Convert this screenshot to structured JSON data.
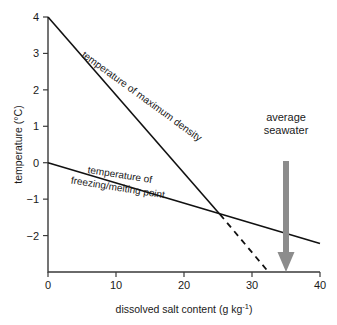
{
  "chart_data": {
    "type": "line",
    "title": "",
    "xlabel": "dissolved salt content (g kg",
    "xlabel_sup": "-1",
    "xlabel_tail": ")",
    "ylabel": "temperature (°C)",
    "xlim": [
      0,
      40
    ],
    "ylim": [
      -3,
      4
    ],
    "xticks": [
      0,
      10,
      20,
      30,
      40
    ],
    "xtick_labels": [
      "0",
      "10",
      "20",
      "30",
      "40"
    ],
    "yticks": [
      4,
      3,
      2,
      1,
      0,
      -1,
      -2
    ],
    "ytick_labels": [
      "4",
      "3",
      "2",
      "1",
      "0",
      "−1",
      "−2"
    ],
    "grid": false,
    "legend": "none",
    "series": [
      {
        "name": "temperature of maximum density",
        "style": "solid",
        "color": "#111111",
        "points": [
          [
            0,
            4.0
          ],
          [
            25.3,
            -1.42
          ]
        ]
      },
      {
        "name": "temperature of maximum density (extrapolated)",
        "style": "dashed",
        "color": "#111111",
        "points": [
          [
            25.3,
            -1.42
          ],
          [
            32.2,
            -2.95
          ]
        ]
      },
      {
        "name": "temperature of freezing/melting point",
        "style": "solid",
        "color": "#111111",
        "points": [
          [
            0,
            0.0
          ],
          [
            40,
            -2.22
          ]
        ]
      }
    ],
    "annotations": [
      {
        "name": "max-density-label",
        "text_lines": [
          "temperature of maximum density"
        ],
        "x": 13.5,
        "y": 1.75,
        "rotation_deg": 36
      },
      {
        "name": "freezing-point-label",
        "text_lines": [
          "temperature of",
          "freezing/melting point"
        ],
        "x": 10.5,
        "y": -0.42,
        "rotation_deg": 9
      },
      {
        "name": "average-seawater-label",
        "text_lines": [
          "average",
          "seawater"
        ],
        "x": 35.0,
        "y": 1.15,
        "rotation_deg": 0
      }
    ],
    "marker_arrow": {
      "name": "average-seawater-arrow",
      "x": 35.0,
      "y_top": 0.05,
      "y_bottom": -3.0,
      "color": "#8c8c8c",
      "direction": "down"
    }
  },
  "credit": ""
}
